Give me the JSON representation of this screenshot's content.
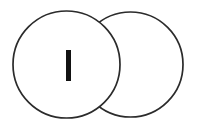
{
  "figure": {
    "title": "Two overlapping circles with a vertical bar glyph",
    "background_color": "#ffffff",
    "canvas": {
      "width": 197,
      "height": 131
    },
    "stroke_color": "#2b2b2b",
    "stroke_width": 1.7,
    "fill_color": "#ffffff",
    "glyph_color": "#121212",
    "shapes": [
      {
        "name": "right-circle",
        "icon": "circle-outline",
        "label": "",
        "cx": 130.5,
        "cy": 64.5,
        "r": 52.5,
        "z": 1
      },
      {
        "name": "left-circle",
        "icon": "circle-outline",
        "label": "",
        "cx": 66.5,
        "cy": 64.5,
        "r": 53.5,
        "z": 2
      }
    ],
    "glyph": {
      "name": "vertical-bar",
      "character": "I",
      "x": 66.0,
      "y": 50.0,
      "width": 5.0,
      "height": 31.0
    }
  }
}
